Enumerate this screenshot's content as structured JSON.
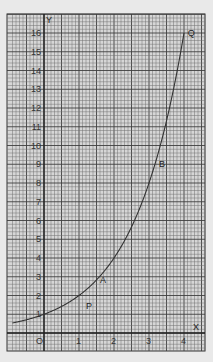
{
  "chart_data": {
    "type": "line",
    "title": "",
    "xlabel": "X",
    "ylabel": "Y",
    "xlim": [
      -0.9,
      4.5
    ],
    "ylim": [
      -1,
      17
    ],
    "grid": true,
    "x_ticks": [
      "0",
      "1",
      "2",
      "3",
      "4"
    ],
    "y_ticks": [
      "1",
      "2",
      "3",
      "4",
      "5",
      "6",
      "7",
      "8",
      "9",
      "10",
      "11",
      "12",
      "13",
      "14",
      "15",
      "16"
    ],
    "series": [
      {
        "name": "y = 2^x",
        "x": [
          -0.9,
          -0.5,
          0,
          0.5,
          1,
          1.5,
          2,
          2.5,
          3,
          3.5,
          4
        ],
        "values": [
          0.54,
          0.71,
          1,
          1.41,
          2,
          2.83,
          4,
          5.66,
          8,
          11.31,
          16
        ]
      }
    ],
    "annotations": [
      {
        "label": "P",
        "x": 1.2,
        "y": 1.5
      },
      {
        "label": "A",
        "x": 1.6,
        "y": 2.8
      },
      {
        "label": "B",
        "x": 3.2,
        "y": 9.0
      },
      {
        "label": "Q",
        "x": 4.05,
        "y": 16.0
      }
    ],
    "legend": "none"
  },
  "axes": {
    "x_label": "X",
    "y_label": "Y",
    "origin_label": "O"
  },
  "colors": {
    "background": "#e9e9e9",
    "paper": "#d9d9d9",
    "grid_fine": "#707070",
    "grid_major": "#404040",
    "axis": "#222222",
    "curve": "#333333"
  }
}
